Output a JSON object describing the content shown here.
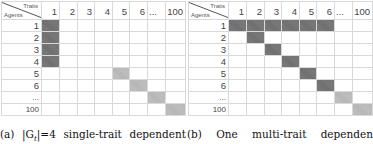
{
  "corner": {
    "traits_label": "Traits",
    "agents_label": "Agents"
  },
  "columns": [
    "1",
    "2",
    "3",
    "4",
    "5",
    "6",
    "...",
    "100"
  ],
  "rows": [
    "1",
    "2",
    "3",
    "4",
    "5",
    "6",
    "...",
    "100"
  ],
  "panels": [
    {
      "id": "a",
      "caption_tokens": [
        "(a)",
        "|G",
        "t",
        "|=4",
        "single-trait",
        "dependent"
      ],
      "caption": "(a) |Gt|=4 single-trait dependent",
      "filled_cells": [
        {
          "row": "1",
          "col": "1",
          "shade": "dark"
        },
        {
          "row": "2",
          "col": "1",
          "shade": "dark"
        },
        {
          "row": "3",
          "col": "1",
          "shade": "dark"
        },
        {
          "row": "4",
          "col": "1",
          "shade": "dark"
        },
        {
          "row": "5",
          "col": "5",
          "shade": "light"
        },
        {
          "row": "6",
          "col": "6",
          "shade": "light"
        },
        {
          "row": "...",
          "col": "...",
          "shade": "light"
        },
        {
          "row": "100",
          "col": "100",
          "shade": "light"
        }
      ]
    },
    {
      "id": "b",
      "caption_tokens": [
        "(b)",
        "One",
        "multi-trait",
        "dependen"
      ],
      "caption": "(b) One multi-trait dependen",
      "filled_cells": [
        {
          "row": "1",
          "col": "1",
          "shade": "dark"
        },
        {
          "row": "1",
          "col": "2",
          "shade": "dark"
        },
        {
          "row": "1",
          "col": "3",
          "shade": "dark"
        },
        {
          "row": "1",
          "col": "4",
          "shade": "dark"
        },
        {
          "row": "1",
          "col": "5",
          "shade": "dark"
        },
        {
          "row": "1",
          "col": "6",
          "shade": "dark"
        },
        {
          "row": "2",
          "col": "2",
          "shade": "dark"
        },
        {
          "row": "3",
          "col": "3",
          "shade": "dark"
        },
        {
          "row": "4",
          "col": "4",
          "shade": "dark"
        },
        {
          "row": "5",
          "col": "5",
          "shade": "dark"
        },
        {
          "row": "6",
          "col": "6",
          "shade": "dark"
        },
        {
          "row": "...",
          "col": "...",
          "shade": "light"
        },
        {
          "row": "100",
          "col": "100",
          "shade": "light"
        }
      ]
    }
  ],
  "colors": {
    "dark_fill": "#6b6b6b",
    "light_fill": "#b3b3b3",
    "grid_line": "#d9d9d9"
  }
}
